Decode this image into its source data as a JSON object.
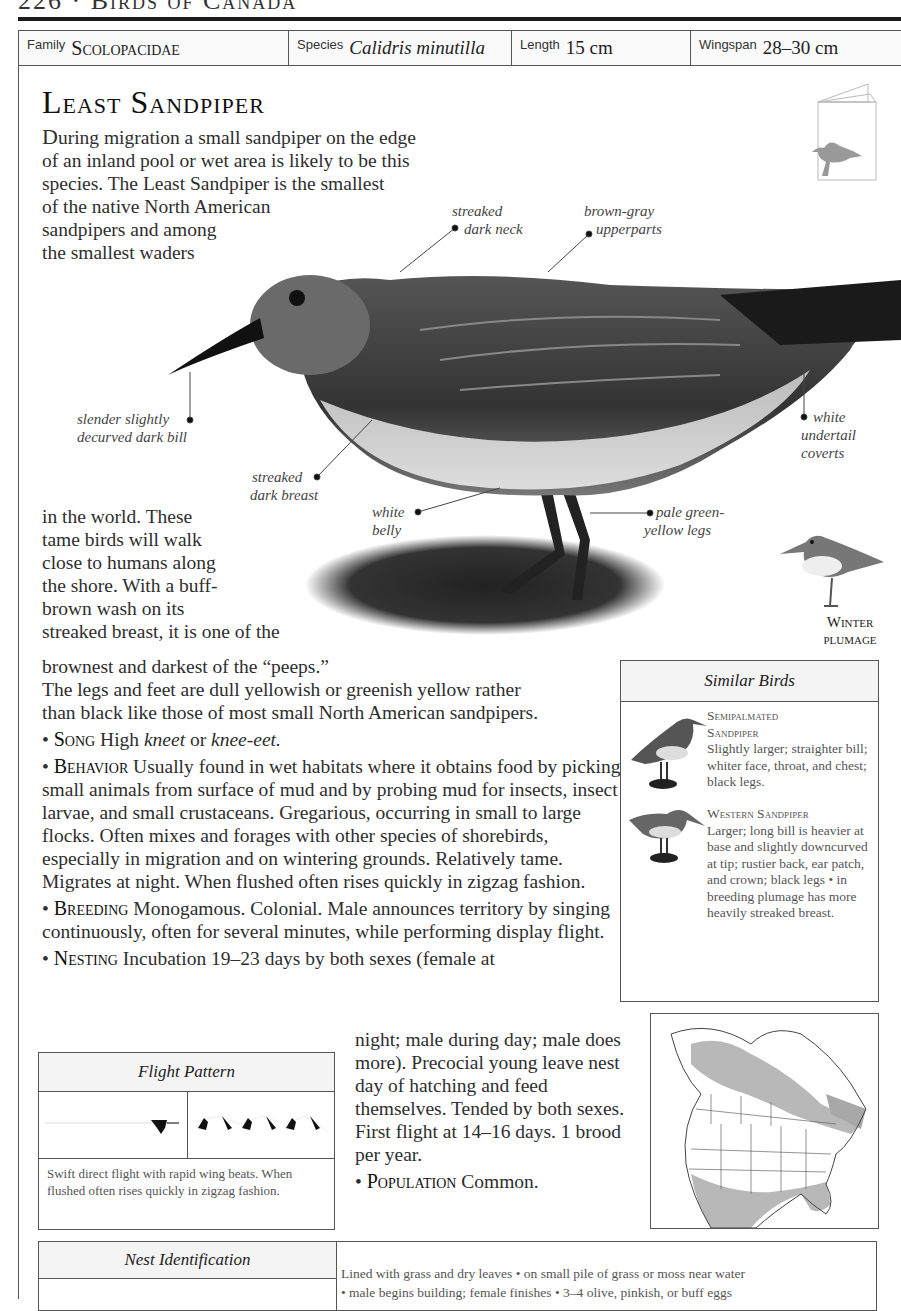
{
  "page": {
    "running_head": "226 · Birds of Canada"
  },
  "info_bar": {
    "family_label": "Family",
    "family_value": "Scolopacidae",
    "species_label": "Species",
    "species_value": "Calidris minutilla",
    "length_label": "Length",
    "length_value": "15 cm",
    "wingspan_label": "Wingspan",
    "wingspan_value": "28–30 cm"
  },
  "title": "Least Sandpiper",
  "intro": {
    "part_a_dropcap": "D",
    "part_a_lines": [
      "uring migration a small sandpiper on the edge",
      "of an inland pool or wet area is likely to be this",
      "species. The Least Sandpiper is the smallest",
      "of the native North American",
      "sandpipers and among",
      "the smallest waders"
    ],
    "part_b_lines": [
      "in the world. These",
      "tame birds will walk",
      "close to humans along",
      "the shore. With a buff-",
      "brown wash on its",
      "streaked breast, it is one of the"
    ],
    "part_c_lines": [
      "brownest and darkest of the “peeps.”",
      "The legs and feet are dull yellowish or greenish yellow rather",
      "than black like those of most small North American sandpipers."
    ]
  },
  "callouts": {
    "neck_1": "streaked",
    "neck_2": "dark neck",
    "upper_1": "brown-gray",
    "upper_2": "upperparts",
    "bill_1": "slender slightly",
    "bill_2": "decurved dark bill",
    "undertail_1": "white",
    "undertail_2": "undertail",
    "undertail_3": "coverts",
    "breast_1": "streaked",
    "breast_2": "dark breast",
    "belly_1": "white",
    "belly_2": "belly",
    "legs_1": "pale green-",
    "legs_2": "yellow legs"
  },
  "winter_plumage": {
    "line1": "Winter",
    "line2": "plumage"
  },
  "sections": {
    "song_head": "Song",
    "song_pre": "High ",
    "song_it1": "kneet",
    "song_mid": " or ",
    "song_it2": "knee-eet.",
    "behavior_head": "Behavior",
    "behavior_text": "Usually found in wet habitats where it obtains food by picking small animals from surface of mud and by probing mud for insects, insect larvae, and small crustaceans. Gregarious, occurring in small to large flocks. Often mixes and forages with other species of shorebirds, especially in migration and on wintering grounds. Relatively tame. Migrates at night. When flushed often rises quickly in zigzag fashion.",
    "breeding_head": "Breeding",
    "breeding_text": "Monogamous. Colonial. Male announces territory by singing continuously, often for several minutes, while performing display flight.",
    "nesting_head": "Nesting",
    "nesting_text_a": "Incubation 19–23 days by both sexes (female at",
    "nesting_text_b": "night; male during day; male does more). Precocial young leave nest day of hatching and feed themselves. Tended by both sexes. First flight at 14–16 days. 1 brood per year.",
    "population_head": "Population",
    "population_text": "Common."
  },
  "similar_birds": {
    "heading": "Similar Birds",
    "items": [
      {
        "name_1": "Semipalmated",
        "name_2": "Sandpiper",
        "desc": "Slightly larger; straighter bill; whiter face, throat, and chest; black legs."
      },
      {
        "name_1": "Western Sandpiper",
        "name_2": "",
        "desc": "Larger; long bill is heavier at base and slightly downcurved at tip; rustier back, ear patch, and crown; black legs • in breeding plumage has more heavily streaked breast."
      }
    ]
  },
  "flight_pattern": {
    "heading": "Flight Pattern",
    "caption": "Swift direct flight with rapid wing beats. When flushed often rises quickly in zigzag fashion."
  },
  "nest_identification": {
    "heading": "Nest Identification",
    "line1": "Lined with grass and dry leaves • on small pile of grass or moss near water",
    "line2": "• male begins building; female finishes • 3–4 olive, pinkish, or buff eggs"
  },
  "colors": {
    "text": "#2e2e2e",
    "rule": "#1a1a1a",
    "border": "#555555",
    "range_shade": "#b8b8b8"
  }
}
